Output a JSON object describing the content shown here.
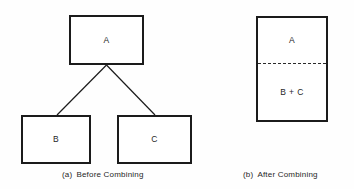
{
  "figure": {
    "background_color": "#fefefe",
    "stroke_color": "#1b1b1b",
    "panels": [
      {
        "id": "before",
        "caption_tag": "(a)",
        "caption_text": "Before Combining"
      },
      {
        "id": "after",
        "caption_tag": "(b)",
        "caption_text": "After Combining"
      }
    ]
  },
  "before_panel": {
    "parent": {
      "label": "A"
    },
    "children": [
      {
        "label": "B"
      },
      {
        "label": "C"
      }
    ],
    "connectors": [
      {
        "from": "A",
        "to": "B"
      },
      {
        "from": "A",
        "to": "C"
      }
    ]
  },
  "after_panel": {
    "top_region": {
      "label": "A"
    },
    "bottom_region": {
      "label": "B + C"
    },
    "divider_style": "dashed"
  },
  "captions": {
    "a": {
      "tag": "(a)",
      "text": "Before Combining"
    },
    "b": {
      "tag": "(b)",
      "text": "After Combining"
    }
  }
}
